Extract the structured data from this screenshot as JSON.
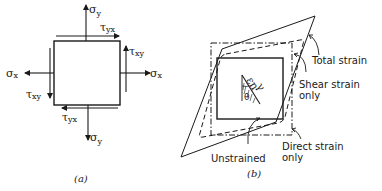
{
  "figure_a": {
    "caption": "(a)",
    "labels": {
      "sigma_y_top": "σ",
      "sigma_y_top_sub": "y",
      "tau_yx_top": "τ",
      "tau_yx_top_sub": "yx",
      "tau_xy_right": "τ",
      "tau_xy_right_sub": "xy",
      "sigma_x_left": "σ",
      "sigma_x_left_sub": "x",
      "sigma_x_right": "σ",
      "sigma_x_right_sub": "x",
      "tau_xy_left": "τ",
      "tau_xy_left_sub": "xy",
      "tau_yx_bottom": "τ",
      "tau_yx_bottom_sub": "yx",
      "sigma_y_bottom": "σ",
      "sigma_y_bottom_sub": "y"
    }
  },
  "figure_b": {
    "caption": "(b)",
    "labels": {
      "total_strain": "Total strain",
      "shear_strain_line1": "Shear strain",
      "shear_strain_line2": "only",
      "direct_strain_line1": "Direct strain",
      "direct_strain_line2": "only",
      "unstrained": "Unstrained",
      "epsilon_n": "εn",
      "gamma": "γ",
      "theta": "θ"
    }
  }
}
